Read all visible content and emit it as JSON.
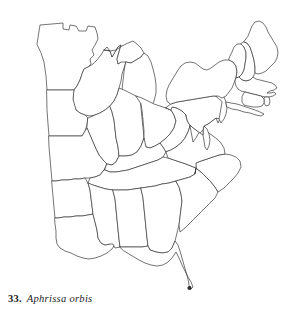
{
  "figure": {
    "caption_number": "33.",
    "caption_species": "Aphrissa orbis",
    "title": "33. Aphrissa orbis",
    "background_color": "#ffffff",
    "outline_color": "#3a3a3a",
    "dot_color": "#2b2b2b"
  },
  "map": {
    "name": "eastern-united-states-distribution-map",
    "region": "Eastern United States",
    "projection_note": "state outlines, no fill, no labels",
    "states_depicted": [
      "Minnesota",
      "Wisconsin",
      "Michigan",
      "Iowa",
      "Illinois",
      "Indiana",
      "Ohio",
      "Missouri",
      "Kentucky",
      "West Virginia",
      "Virginia",
      "Pennsylvania",
      "New York",
      "Vermont",
      "New Hampshire",
      "Maine",
      "Massachusetts",
      "Connecticut",
      "Rhode Island",
      "New Jersey",
      "Delaware",
      "Maryland",
      "North Carolina",
      "South Carolina",
      "Tennessee",
      "Arkansas",
      "Louisiana",
      "Mississippi",
      "Alabama",
      "Georgia",
      "Florida"
    ]
  },
  "records": {
    "count": 1,
    "points": [
      {
        "label": "south-florida-record",
        "state": "Florida",
        "x": 189.5,
        "y": 288.0,
        "r": 2.1
      }
    ]
  }
}
